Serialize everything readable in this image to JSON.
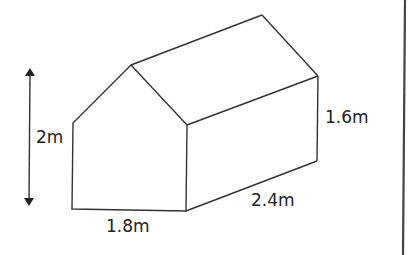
{
  "diagram": {
    "type": "3d-prism-house",
    "labels": {
      "total_height": "2m",
      "wall_height": "1.6m",
      "width": "1.8m",
      "length": "2.4m"
    },
    "colors": {
      "line": "#333333",
      "text": "#222222",
      "background": "#ffffff"
    }
  }
}
